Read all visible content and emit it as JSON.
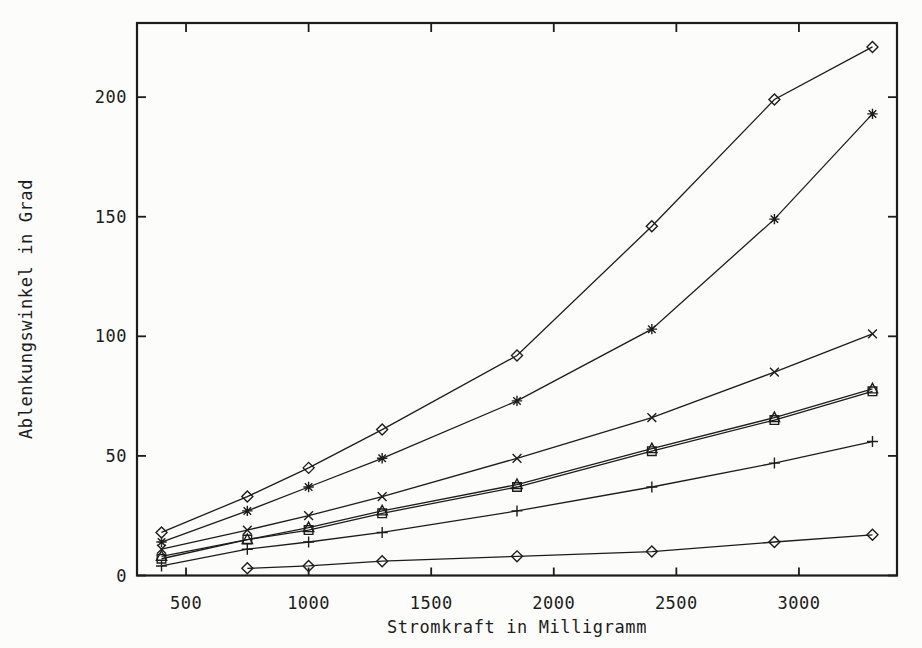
{
  "page": {
    "paper_color": "#fcfcfa",
    "ink_color": "#1c1c1c"
  },
  "chart_data": {
    "type": "line",
    "title": "",
    "xlabel": "Stromkraft in Milligramm",
    "ylabel": "Ablenkungswinkel in Grad",
    "x": [
      400,
      750,
      1000,
      1300,
      1850,
      2400,
      2900,
      3300
    ],
    "xticks": [
      500,
      1000,
      1500,
      2000,
      2500,
      3000
    ],
    "yticks": [
      0,
      50,
      100,
      150,
      200
    ],
    "xlim": [
      300,
      3400
    ],
    "ylim": [
      0,
      231
    ],
    "grid": false,
    "legend": "none",
    "line_color": "#1c1c1c",
    "series": [
      {
        "name": "kurve-1-raute",
        "marker": "diamond",
        "values": [
          18,
          33,
          45,
          61,
          92,
          146,
          199,
          221
        ]
      },
      {
        "name": "kurve-2-stern",
        "marker": "star",
        "values": [
          14,
          27,
          37,
          49,
          73,
          103,
          149,
          193
        ]
      },
      {
        "name": "kurve-3-kreuz",
        "marker": "x",
        "values": [
          11,
          19,
          25,
          33,
          49,
          66,
          85,
          101
        ]
      },
      {
        "name": "kurve-4-dreieck",
        "marker": "triangle",
        "values": [
          8,
          15,
          20,
          27,
          38,
          53,
          66,
          78
        ]
      },
      {
        "name": "kurve-5-quadrat",
        "marker": "square",
        "values": [
          7,
          15,
          19,
          26,
          37,
          52,
          65,
          77
        ]
      },
      {
        "name": "kurve-6-plus",
        "marker": "plus",
        "values": [
          4,
          11,
          14,
          18,
          27,
          37,
          47,
          56
        ]
      },
      {
        "name": "kurve-7-raute-flach",
        "marker": "diamond",
        "x": [
          750,
          1000,
          1300,
          1850,
          2400,
          2900,
          3300
        ],
        "values": [
          3,
          4,
          6,
          8,
          10,
          14,
          17
        ]
      }
    ]
  }
}
